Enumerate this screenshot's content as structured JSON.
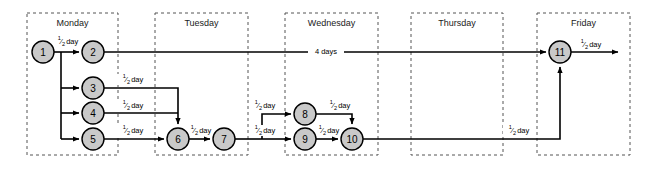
{
  "diagram": {
    "type": "activity-network",
    "canvas": {
      "width": 653,
      "height": 169
    },
    "colors": {
      "node_fill": "#c9c9c9",
      "node_stroke": "#000000",
      "edge": "#000000",
      "day_box_stroke": "#555555",
      "background": "#ffffff"
    },
    "day_columns": [
      {
        "id": "monday",
        "label": "Monday",
        "x": 27,
        "y": 13,
        "width": 91,
        "height": 142
      },
      {
        "id": "tuesday",
        "label": "Tuesday",
        "x": 155,
        "y": 13,
        "width": 93,
        "height": 142
      },
      {
        "id": "wednesday",
        "label": "Wednesday",
        "x": 285,
        "y": 13,
        "width": 93,
        "height": 142
      },
      {
        "id": "thursday",
        "label": "Thursday",
        "x": 411,
        "y": 13,
        "width": 92,
        "height": 142
      },
      {
        "id": "friday",
        "label": "Friday",
        "x": 537,
        "y": 13,
        "width": 93,
        "height": 142
      }
    ],
    "nodes": [
      {
        "id": "n1",
        "label": "1",
        "cx": 43,
        "cy": 52,
        "r": 11
      },
      {
        "id": "n2",
        "label": "2",
        "cx": 93,
        "cy": 52,
        "r": 11
      },
      {
        "id": "n3",
        "label": "3",
        "cx": 93,
        "cy": 88,
        "r": 11
      },
      {
        "id": "n4",
        "label": "4",
        "cx": 93,
        "cy": 113,
        "r": 11
      },
      {
        "id": "n5",
        "label": "5",
        "cx": 93,
        "cy": 139,
        "r": 11
      },
      {
        "id": "n6",
        "label": "6",
        "cx": 178,
        "cy": 139,
        "r": 11
      },
      {
        "id": "n7",
        "label": "7",
        "cx": 224,
        "cy": 139,
        "r": 11
      },
      {
        "id": "n8",
        "label": "8",
        "cx": 305,
        "cy": 114,
        "r": 11
      },
      {
        "id": "n9",
        "label": "9",
        "cx": 305,
        "cy": 139,
        "r": 11
      },
      {
        "id": "n10",
        "label": "10",
        "cx": 352,
        "cy": 139,
        "r": 11
      },
      {
        "id": "n11",
        "label": "11",
        "cx": 560,
        "cy": 52,
        "r": 11
      }
    ],
    "edge_labels": [
      {
        "id": "e1-2",
        "text": "½ day",
        "fraction": true,
        "numerator": "1",
        "denominator": "2",
        "unit": "day",
        "x": 68,
        "y": 42
      },
      {
        "id": "e3-6",
        "text": "½ day",
        "fraction": true,
        "numerator": "1",
        "denominator": "2",
        "unit": "day",
        "x": 133,
        "y": 80
      },
      {
        "id": "e4-6",
        "text": "½ day",
        "fraction": true,
        "numerator": "1",
        "denominator": "2",
        "unit": "day",
        "x": 133,
        "y": 106
      },
      {
        "id": "e5-6",
        "text": "½ day",
        "fraction": true,
        "numerator": "1",
        "denominator": "2",
        "unit": "day",
        "x": 133,
        "y": 131
      },
      {
        "id": "e6-7",
        "text": "½ day",
        "fraction": true,
        "numerator": "1",
        "denominator": "2",
        "unit": "day",
        "x": 201,
        "y": 131
      },
      {
        "id": "e7-8",
        "text": "½ day",
        "fraction": true,
        "numerator": "1",
        "denominator": "2",
        "unit": "day",
        "x": 265,
        "y": 106
      },
      {
        "id": "e7-9",
        "text": "½ day",
        "fraction": true,
        "numerator": "1",
        "denominator": "2",
        "unit": "day",
        "x": 265,
        "y": 131
      },
      {
        "id": "e8-10",
        "text": "½ day",
        "fraction": true,
        "numerator": "1",
        "denominator": "2",
        "unit": "day",
        "x": 340,
        "y": 106
      },
      {
        "id": "e9-10",
        "text": "½ day",
        "fraction": true,
        "numerator": "1",
        "denominator": "2",
        "unit": "day",
        "x": 329,
        "y": 131
      },
      {
        "id": "e2-11",
        "text": "4 days",
        "fraction": false,
        "numerator": "",
        "denominator": "",
        "unit": "4 days",
        "x": 326,
        "y": 45
      },
      {
        "id": "e10-11",
        "text": "½ day",
        "fraction": true,
        "numerator": "1",
        "denominator": "2",
        "unit": "day",
        "x": 519,
        "y": 131
      },
      {
        "id": "e11-out",
        "text": "½ day",
        "fraction": true,
        "numerator": "1",
        "denominator": "2",
        "unit": "day",
        "x": 591,
        "y": 45
      }
    ],
    "edges": [
      {
        "id": "edge-1-2",
        "from": "n1",
        "to": "n2",
        "duration": "½ day"
      },
      {
        "id": "edge-1-3",
        "from": "n1",
        "to": "n3",
        "duration": ""
      },
      {
        "id": "edge-1-4",
        "from": "n1",
        "to": "n4",
        "duration": ""
      },
      {
        "id": "edge-1-5",
        "from": "n1",
        "to": "n5",
        "duration": ""
      },
      {
        "id": "edge-3-6",
        "from": "n3",
        "to": "n6",
        "duration": "½ day"
      },
      {
        "id": "edge-4-6",
        "from": "n4",
        "to": "n6",
        "duration": "½ day"
      },
      {
        "id": "edge-5-6",
        "from": "n5",
        "to": "n6",
        "duration": "½ day"
      },
      {
        "id": "edge-6-7",
        "from": "n6",
        "to": "n7",
        "duration": "½ day"
      },
      {
        "id": "edge-7-8",
        "from": "n7",
        "to": "n8",
        "duration": "½ day"
      },
      {
        "id": "edge-7-9",
        "from": "n7",
        "to": "n9",
        "duration": "½ day"
      },
      {
        "id": "edge-8-10",
        "from": "n8",
        "to": "n10",
        "duration": "½ day"
      },
      {
        "id": "edge-9-10",
        "from": "n9",
        "to": "n10",
        "duration": "½ day"
      },
      {
        "id": "edge-2-11",
        "from": "n2",
        "to": "n11",
        "duration": "4 days"
      },
      {
        "id": "edge-10-11",
        "from": "n10",
        "to": "n11",
        "duration": "½ day"
      },
      {
        "id": "edge-11-out",
        "from": "n11",
        "to": "end",
        "duration": "½ day"
      }
    ]
  }
}
